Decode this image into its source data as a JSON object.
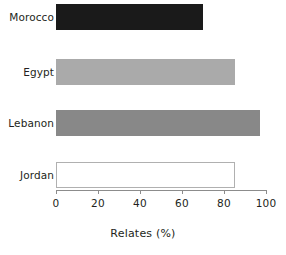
{
  "chart_data": {
    "type": "bar",
    "orientation": "horizontal",
    "title": "",
    "xlabel": "Relates (%)",
    "ylabel": "",
    "categories": [
      "Morocco",
      "Egypt",
      "Lebanon",
      "Jordan"
    ],
    "values": [
      70,
      85,
      97,
      85
    ],
    "xlim": [
      0,
      100
    ],
    "xticks": [
      0,
      20,
      40,
      60,
      80,
      100
    ],
    "xtick_labels": [
      "0",
      "20",
      "40",
      "60",
      "80",
      "100"
    ],
    "grid": false,
    "legend": false,
    "series": [
      {
        "name": "Relates (%)",
        "points": [
          {
            "category": "Morocco",
            "value": 70,
            "fill": "#1a1a1a",
            "stroke": "#1a1a1a"
          },
          {
            "category": "Egypt",
            "value": 85,
            "fill": "#aaaaaa",
            "stroke": "#aaaaaa"
          },
          {
            "category": "Lebanon",
            "value": 97,
            "fill": "#888888",
            "stroke": "#888888"
          },
          {
            "category": "Jordan",
            "value": 85,
            "fill": "#ffffff",
            "stroke": "#b0b0b0"
          }
        ]
      }
    ],
    "colors": {
      "axis": "#8c8c8c",
      "text": "#231f20",
      "background": "#ffffff",
      "morocco": "#1a1a1a",
      "egypt": "#aaaaaa",
      "lebanon": "#888888",
      "jordan_fill": "#ffffff",
      "jordan_stroke": "#b0b0b0"
    }
  },
  "axis": {
    "x_title": "Relates (%)"
  }
}
